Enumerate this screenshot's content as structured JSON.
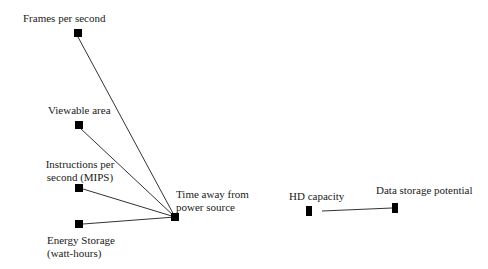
{
  "diagram": {
    "type": "node-link",
    "nodes": [
      {
        "id": "frames",
        "label": "Frames per second"
      },
      {
        "id": "viewable",
        "label": "Viewable area"
      },
      {
        "id": "mips",
        "label_line1": "Instructions per",
        "label_line2": "second (MIPS)"
      },
      {
        "id": "energy",
        "label_line1": "Energy Storage",
        "label_line2": "(watt-hours)"
      },
      {
        "id": "time",
        "label_line1": "Time away from",
        "label_line2": "power source"
      },
      {
        "id": "hd",
        "label": "HD capacity"
      },
      {
        "id": "storage",
        "label": "Data storage potential"
      }
    ],
    "edges": [
      {
        "from": "frames",
        "to": "time"
      },
      {
        "from": "viewable",
        "to": "time"
      },
      {
        "from": "mips",
        "to": "time"
      },
      {
        "from": "energy",
        "to": "time"
      },
      {
        "from": "hd",
        "to": "storage"
      }
    ],
    "colors": {
      "node": "#000000",
      "edge": "#333333",
      "text": "#1a1a1a"
    }
  }
}
